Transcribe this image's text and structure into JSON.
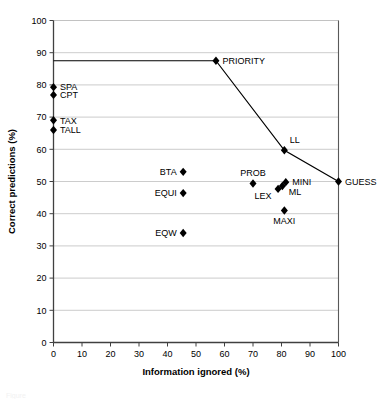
{
  "chart_data": {
    "type": "scatter",
    "title": "",
    "xlabel": "Information ignored (%)",
    "ylabel": "Correct predictions (%)",
    "xlim": [
      0,
      100
    ],
    "ylim": [
      0,
      100
    ],
    "xticks": [
      0,
      10,
      20,
      30,
      40,
      50,
      60,
      70,
      80,
      90,
      100
    ],
    "yticks": [
      0,
      10,
      20,
      30,
      40,
      50,
      60,
      70,
      80,
      90,
      100
    ],
    "xtick_labels": [
      "0",
      "10",
      "20",
      "30",
      "40",
      "50",
      "60",
      "70",
      "80",
      "90",
      "100"
    ],
    "ytick_labels": [
      "0",
      "10",
      "20",
      "30",
      "40",
      "50",
      "60",
      "70",
      "80",
      "90",
      "100"
    ],
    "grid": "horizontal",
    "legend": "none",
    "marker": "filled-diamond",
    "marker_color": "#000000",
    "points": [
      {
        "label": "PRIORITY",
        "x": 57,
        "y": 87.5,
        "label_pos": "right"
      },
      {
        "label": "SPA",
        "x": 0,
        "y": 79.3,
        "label_pos": "right"
      },
      {
        "label": "CPT",
        "x": 0,
        "y": 76.9,
        "label_pos": "right"
      },
      {
        "label": "TAX",
        "x": 0,
        "y": 69.0,
        "label_pos": "right"
      },
      {
        "label": "TALL",
        "x": 0,
        "y": 66.0,
        "label_pos": "right"
      },
      {
        "label": "LL",
        "x": 81,
        "y": 59.7,
        "label_pos": "above-right"
      },
      {
        "label": "BTA",
        "x": 45.5,
        "y": 53.0,
        "label_pos": "left"
      },
      {
        "label": "GUESS",
        "x": 100,
        "y": 50.0,
        "label_pos": "right"
      },
      {
        "label": "MINI",
        "x": 81.5,
        "y": 49.8,
        "label_pos": "right"
      },
      {
        "label": "ML",
        "x": 80.3,
        "y": 48.6,
        "label_pos": "below-right"
      },
      {
        "label": "PROB",
        "x": 70,
        "y": 49.4,
        "label_pos": "above"
      },
      {
        "label": "LEX",
        "x": 78.8,
        "y": 47.7,
        "label_pos": "below-left"
      },
      {
        "label": "EQUI",
        "x": 45.5,
        "y": 46.4,
        "label_pos": "left"
      },
      {
        "label": "MAXI",
        "x": 81,
        "y": 41.0,
        "label_pos": "below"
      },
      {
        "label": "EQW",
        "x": 45.5,
        "y": 34.0,
        "label_pos": "left"
      }
    ],
    "lines": [
      {
        "name": "frontier",
        "color": "#000000",
        "points": [
          {
            "x": 0,
            "y": 87.5
          },
          {
            "x": 57,
            "y": 87.5
          },
          {
            "x": 81,
            "y": 59.7
          },
          {
            "x": 100,
            "y": 50.0
          }
        ]
      }
    ]
  },
  "figure": {
    "caption": "Figure"
  }
}
